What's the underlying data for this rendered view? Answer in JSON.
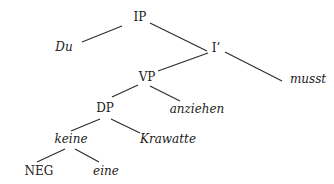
{
  "tree": {
    "nodes": [
      {
        "id": "IP",
        "label": "IP",
        "italic": false,
        "x": 140,
        "y": 17
      },
      {
        "id": "Du",
        "label": "Du",
        "italic": true,
        "x": 64,
        "y": 47
      },
      {
        "id": "Ibar",
        "label": "I’",
        "italic": false,
        "x": 216,
        "y": 48
      },
      {
        "id": "VP",
        "label": "VP",
        "italic": false,
        "x": 147,
        "y": 77
      },
      {
        "id": "musst",
        "label": "musst",
        "italic": true,
        "x": 308,
        "y": 79
      },
      {
        "id": "DP",
        "label": "DP",
        "italic": false,
        "x": 105,
        "y": 108
      },
      {
        "id": "anziehen",
        "label": "anziehen",
        "italic": true,
        "x": 197,
        "y": 109
      },
      {
        "id": "keine",
        "label": "keine",
        "italic": true,
        "x": 71,
        "y": 139
      },
      {
        "id": "Krawatte",
        "label": "Krawatte",
        "italic": true,
        "x": 168,
        "y": 139
      },
      {
        "id": "NEG",
        "label": "NEG",
        "italic": false,
        "x": 39,
        "y": 171
      },
      {
        "id": "eine",
        "label": "eine",
        "italic": true,
        "x": 106,
        "y": 171
      }
    ],
    "edges": [
      {
        "from": "IP",
        "to": "Du",
        "x1": 122,
        "y1": 26,
        "x2": 82,
        "y2": 42
      },
      {
        "from": "IP",
        "to": "Ibar",
        "x1": 150,
        "y1": 23,
        "x2": 207,
        "y2": 51
      },
      {
        "from": "Ibar",
        "to": "VP",
        "x1": 208,
        "y1": 53,
        "x2": 158,
        "y2": 71
      },
      {
        "from": "Ibar",
        "to": "musst",
        "x1": 225,
        "y1": 52,
        "x2": 282,
        "y2": 81
      },
      {
        "from": "VP",
        "to": "DP",
        "x1": 138,
        "y1": 85,
        "x2": 112,
        "y2": 97
      },
      {
        "from": "VP",
        "to": "anziehen",
        "x1": 150,
        "y1": 86,
        "x2": 180,
        "y2": 101
      },
      {
        "from": "DP",
        "to": "keine",
        "x1": 100,
        "y1": 119,
        "x2": 71,
        "y2": 131
      },
      {
        "from": "DP",
        "to": "Krawatte",
        "x1": 111,
        "y1": 119,
        "x2": 140,
        "y2": 133
      },
      {
        "from": "keine",
        "to": "NEG",
        "x1": 65,
        "y1": 149,
        "x2": 37,
        "y2": 162
      },
      {
        "from": "keine",
        "to": "eine",
        "x1": 75,
        "y1": 149,
        "x2": 99,
        "y2": 162
      }
    ]
  },
  "colors": {
    "line": "#2a2a2a",
    "text": "#222222",
    "background": "#ffffff"
  }
}
